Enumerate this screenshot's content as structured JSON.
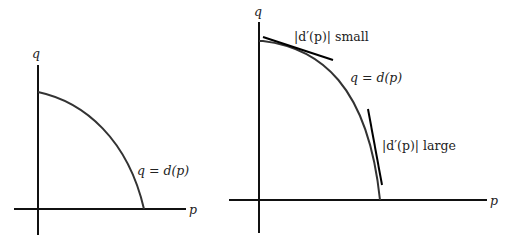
{
  "figures": [
    {
      "id": "demand-curve",
      "y_axis_label": "q",
      "x_axis_label": "p",
      "curve_label": "q = d(p)"
    },
    {
      "id": "demand-curve-with-tangents",
      "y_axis_label": "q",
      "x_axis_label": "p",
      "curve_label": "q = d(p)",
      "tangent_small_label": "|d′(p)| small",
      "tangent_large_label": "|d′(p)| large"
    }
  ],
  "colors": {
    "background": "#ffffff",
    "ink": "#111111",
    "curve": "#333333"
  }
}
